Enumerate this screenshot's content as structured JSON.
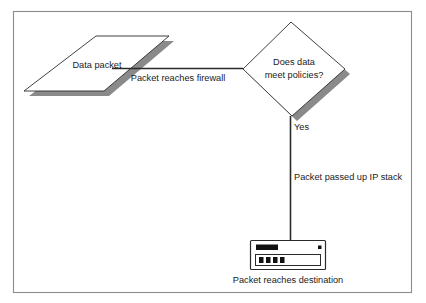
{
  "diagram": {
    "type": "flowchart",
    "background_color": "#ffffff",
    "frame": {
      "name": "figure-border",
      "stroke_color": "#8c8c8c"
    },
    "palette": {
      "shape_stroke": "#2b2b2b",
      "shape_fill": "#ffffff",
      "shadow": "#8a8a8a",
      "text": "#1a1a1a",
      "connector": "#2b2b2b",
      "device_accent": "#111111"
    },
    "nodes": [
      {
        "id": "data-packet",
        "shape": "parallelogram",
        "label": "Data packet",
        "has_shadow": true
      },
      {
        "id": "policy-decision",
        "shape": "diamond",
        "label_line_1": "Does data",
        "label_line_2": "meet policies?",
        "has_shadow": true
      },
      {
        "id": "destination-server",
        "shape": "device",
        "label": "Packet reaches destination",
        "led_count": 4
      }
    ],
    "edges": [
      {
        "id": "packet-to-firewall",
        "from": "data-packet",
        "to": "policy-decision",
        "label": "Packet reaches firewall",
        "orientation": "horizontal"
      },
      {
        "id": "decision-to-server",
        "from": "policy-decision",
        "to": "destination-server",
        "branch_label": "Yes",
        "label": "Packet passed up IP stack",
        "orientation": "vertical"
      }
    ]
  }
}
